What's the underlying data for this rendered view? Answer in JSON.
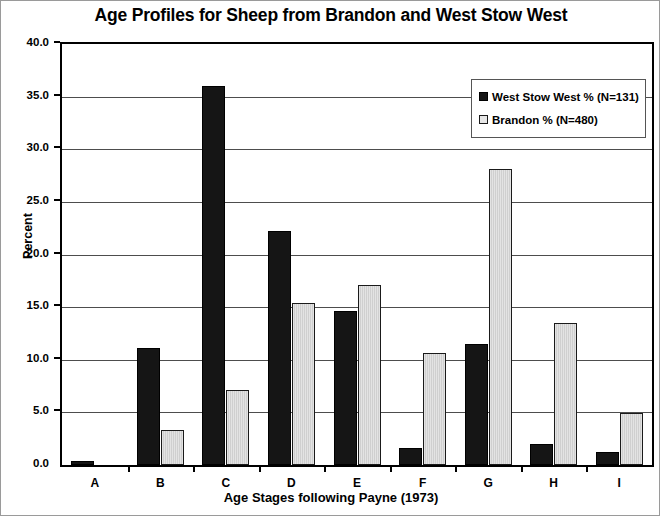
{
  "chart_data": {
    "type": "bar",
    "title": "Age Profiles for Sheep from Brandon and West Stow West",
    "xlabel": "Age Stages following Payne (1973)",
    "ylabel": "Percent",
    "categories": [
      "A",
      "B",
      "C",
      "D",
      "E",
      "F",
      "G",
      "H",
      "I"
    ],
    "series": [
      {
        "name": "West Stow West % (N=131)",
        "color": "#151515",
        "values": [
          0.4,
          11.1,
          36.0,
          22.2,
          14.6,
          1.6,
          11.5,
          2.0,
          1.2
        ]
      },
      {
        "name": "Brandon % (N=480)",
        "color": "#e0e0e0",
        "values": [
          0.0,
          3.3,
          7.1,
          15.4,
          17.1,
          10.6,
          28.1,
          13.5,
          4.9
        ]
      }
    ],
    "ylim": [
      0.0,
      40.0
    ],
    "ytick_step": 5.0,
    "ytick_labels": [
      "40.0",
      "35.0",
      "30.0",
      "25.0",
      "20.0",
      "15.0",
      "10.0",
      "5.0",
      "0.0"
    ],
    "ytick_values": [
      40.0,
      35.0,
      30.0,
      25.0,
      20.0,
      15.0,
      10.0,
      5.0,
      0.0
    ],
    "grid": true,
    "legend_position": "top-right"
  },
  "legend": {
    "entries": [
      {
        "label": "West Stow West % (N=131)",
        "swatch": "dark"
      },
      {
        "label": "Brandon % (N=480)",
        "swatch": "light"
      }
    ]
  }
}
